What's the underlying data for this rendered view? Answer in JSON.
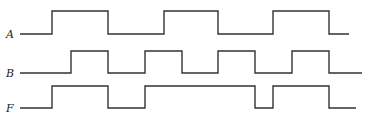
{
  "diagram": {
    "type": "digital-timing-diagram",
    "stroke_color": "#333333",
    "signals": [
      {
        "name": "A",
        "label_x": 6,
        "label_y": 29,
        "low_y": 34,
        "high_y": 11,
        "start_x": 20,
        "end_x": 349,
        "initial": 0,
        "transitions_x": [
          52,
          108,
          164,
          218,
          273,
          329
        ]
      },
      {
        "name": "B",
        "label_x": 6,
        "label_y": 68,
        "low_y": 73,
        "high_y": 51,
        "start_x": 20,
        "end_x": 362,
        "initial": 0,
        "transitions_x": [
          71,
          108,
          145,
          182,
          218,
          255,
          292,
          329
        ]
      },
      {
        "name": "F",
        "label_x": 6,
        "label_y": 103,
        "low_y": 108,
        "high_y": 86,
        "start_x": 20,
        "end_x": 356,
        "initial": 0,
        "transitions_x": [
          52,
          108,
          145,
          255,
          273,
          329
        ]
      }
    ]
  }
}
